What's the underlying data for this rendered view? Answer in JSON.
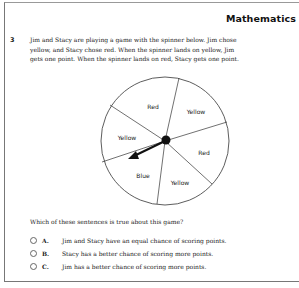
{
  "header": {
    "subject": "Mathematics"
  },
  "question": {
    "number": "3",
    "stem_lines": [
      "Jim and Stacy are playing a game with the spinner below. Jim chose",
      "yellow, and Stacy chose red. When the spinner lands on yellow, Jim",
      "gets one point. When the spinner lands on red, Stacy gets one point."
    ],
    "spinner": {
      "sections": [
        "Red",
        "Yellow",
        "Red",
        "Yellow",
        "Blue",
        "Yellow"
      ]
    },
    "prompt": "Which of these sentences is true about this game?",
    "choices": [
      {
        "letter": "A.",
        "text": "Jim and Stacy have an equal chance of scoring points."
      },
      {
        "letter": "B.",
        "text": "Stacy has a better chance of scoring more points."
      },
      {
        "letter": "C.",
        "text": "Jim has a better chance of scoring more points."
      }
    ]
  }
}
